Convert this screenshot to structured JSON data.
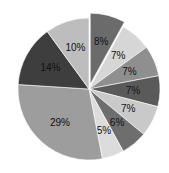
{
  "chart_data": {
    "type": "pie",
    "title": "",
    "start_angle_deg": 0,
    "direction": "clockwise",
    "slices": [
      {
        "label": "8%",
        "value": 8,
        "color": "#6b6b6b",
        "explode": 5
      },
      {
        "label": "7%",
        "value": 7,
        "color": "#d6d6d6",
        "explode": 0
      },
      {
        "label": "7%",
        "value": 7,
        "color": "#8f8f8f",
        "explode": 0
      },
      {
        "label": "7%",
        "value": 7,
        "color": "#5a5a5a",
        "explode": 0
      },
      {
        "label": "7%",
        "value": 7,
        "color": "#c9c9c9",
        "explode": 0
      },
      {
        "label": "6%",
        "value": 6,
        "color": "#6e6e6e",
        "explode": 0
      },
      {
        "label": "5%",
        "value": 5,
        "color": "#dcdcdc",
        "explode": 0
      },
      {
        "label": "29%",
        "value": 29,
        "color": "#9d9d9d",
        "explode": 0
      },
      {
        "label": "14%",
        "value": 14,
        "color": "#3e3e3e",
        "explode": 0
      },
      {
        "label": "10%",
        "value": 10,
        "color": "#bdbdbd",
        "explode": 0
      }
    ],
    "legend": null
  }
}
